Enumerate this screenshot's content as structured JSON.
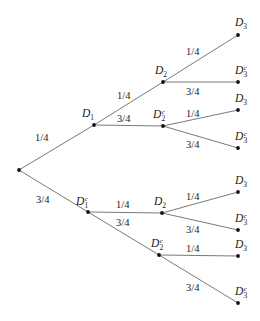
{
  "diagram": {
    "type": "probability-tree",
    "colors": {
      "edge": "#6a6a6a",
      "node": "#111111",
      "text": "#222222"
    },
    "nodes": [
      {
        "id": "root",
        "x": 19,
        "y": 170,
        "label": "",
        "complement": false,
        "sub": ""
      },
      {
        "id": "d1",
        "x": 94,
        "y": 125,
        "label": "D",
        "sub": "1",
        "complement": false,
        "lx": 82,
        "ly": 117
      },
      {
        "id": "d1c",
        "x": 88,
        "y": 212,
        "label": "D",
        "sub": "1",
        "complement": true,
        "lx": 76,
        "ly": 205
      },
      {
        "id": "d2a",
        "x": 163,
        "y": 82,
        "label": "D",
        "sub": "2",
        "complement": false,
        "lx": 155,
        "ly": 74
      },
      {
        "id": "d2ca",
        "x": 163,
        "y": 126,
        "label": "D",
        "sub": "2",
        "complement": true,
        "lx": 153,
        "ly": 118
      },
      {
        "id": "d2b",
        "x": 162,
        "y": 213,
        "label": "D",
        "sub": "2",
        "complement": false,
        "lx": 154,
        "ly": 205
      },
      {
        "id": "d2cb",
        "x": 159,
        "y": 255,
        "label": "D",
        "sub": "2",
        "complement": true,
        "lx": 151,
        "ly": 247
      },
      {
        "id": "l1",
        "x": 238,
        "y": 35,
        "label": "D",
        "sub": "3",
        "complement": false,
        "lx": 235,
        "ly": 26
      },
      {
        "id": "l2",
        "x": 238,
        "y": 82,
        "label": "D",
        "sub": "3",
        "complement": true,
        "lx": 235,
        "ly": 74
      },
      {
        "id": "l3",
        "x": 238,
        "y": 110,
        "label": "D",
        "sub": "3",
        "complement": false,
        "lx": 235,
        "ly": 102
      },
      {
        "id": "l4",
        "x": 238,
        "y": 148,
        "label": "D",
        "sub": "3",
        "complement": true,
        "lx": 235,
        "ly": 140
      },
      {
        "id": "l5",
        "x": 238,
        "y": 192,
        "label": "D",
        "sub": "3",
        "complement": false,
        "lx": 235,
        "ly": 184
      },
      {
        "id": "l6",
        "x": 238,
        "y": 230,
        "label": "D",
        "sub": "3",
        "complement": true,
        "lx": 235,
        "ly": 222
      },
      {
        "id": "l7",
        "x": 238,
        "y": 256,
        "label": "D",
        "sub": "3",
        "complement": false,
        "lx": 235,
        "ly": 248
      },
      {
        "id": "l8",
        "x": 238,
        "y": 303,
        "label": "D",
        "sub": "3",
        "complement": true,
        "lx": 235,
        "ly": 295
      }
    ],
    "edges": [
      {
        "from": "root",
        "to": "d1",
        "prob": "1/4",
        "lx": 35,
        "ly": 141
      },
      {
        "from": "root",
        "to": "d1c",
        "prob": "3/4",
        "lx": 36,
        "ly": 203
      },
      {
        "from": "d1",
        "to": "d2a",
        "prob": "1/4",
        "lx": 117,
        "ly": 99
      },
      {
        "from": "d1",
        "to": "d2ca",
        "prob": "3/4",
        "lx": 117,
        "ly": 122
      },
      {
        "from": "d1c",
        "to": "d2b",
        "prob": "1/4",
        "lx": 116,
        "ly": 208
      },
      {
        "from": "d1c",
        "to": "d2cb",
        "prob": "3/4",
        "lx": 116,
        "ly": 226
      },
      {
        "from": "d2a",
        "to": "l1",
        "prob": "1/4",
        "lx": 186,
        "ly": 55
      },
      {
        "from": "d2a",
        "to": "l2",
        "prob": "3/4",
        "lx": 186,
        "ly": 95
      },
      {
        "from": "d2ca",
        "to": "l3",
        "prob": "1/4",
        "lx": 186,
        "ly": 117
      },
      {
        "from": "d2ca",
        "to": "l4",
        "prob": "3/4",
        "lx": 186,
        "ly": 148
      },
      {
        "from": "d2b",
        "to": "l5",
        "prob": "1/4",
        "lx": 186,
        "ly": 200
      },
      {
        "from": "d2b",
        "to": "l6",
        "prob": "3/4",
        "lx": 186,
        "ly": 233
      },
      {
        "from": "d2cb",
        "to": "l7",
        "prob": "1/4",
        "lx": 186,
        "ly": 252
      },
      {
        "from": "d2cb",
        "to": "l8",
        "prob": "3/4",
        "lx": 186,
        "ly": 291
      }
    ]
  }
}
